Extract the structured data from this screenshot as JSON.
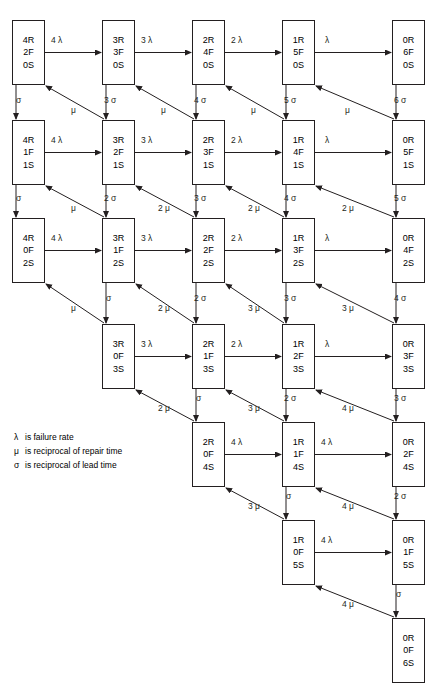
{
  "diagram": {
    "box_width": 33,
    "box_height": 65,
    "col_x": [
      12,
      102,
      192,
      282,
      392
    ],
    "row_y": [
      20,
      120,
      218,
      324,
      422,
      520,
      618
    ],
    "nodes": [
      {
        "id": "r1c1",
        "row": 0,
        "col": 0,
        "lines": [
          "4R",
          "2F",
          "0S"
        ]
      },
      {
        "id": "r1c2",
        "row": 0,
        "col": 1,
        "lines": [
          "3R",
          "3F",
          "0S"
        ]
      },
      {
        "id": "r1c3",
        "row": 0,
        "col": 2,
        "lines": [
          "2R",
          "4F",
          "0S"
        ]
      },
      {
        "id": "r1c4",
        "row": 0,
        "col": 3,
        "lines": [
          "1R",
          "5F",
          "0S"
        ]
      },
      {
        "id": "r1c5",
        "row": 0,
        "col": 4,
        "lines": [
          "0R",
          "6F",
          "0S"
        ]
      },
      {
        "id": "r2c1",
        "row": 1,
        "col": 0,
        "lines": [
          "4R",
          "1F",
          "1S"
        ]
      },
      {
        "id": "r2c2",
        "row": 1,
        "col": 1,
        "lines": [
          "3R",
          "2F",
          "1S"
        ]
      },
      {
        "id": "r2c3",
        "row": 1,
        "col": 2,
        "lines": [
          "2R",
          "3F",
          "1S"
        ]
      },
      {
        "id": "r2c4",
        "row": 1,
        "col": 3,
        "lines": [
          "1R",
          "4F",
          "1S"
        ]
      },
      {
        "id": "r2c5",
        "row": 1,
        "col": 4,
        "lines": [
          "0R",
          "5F",
          "1S"
        ]
      },
      {
        "id": "r3c1",
        "row": 2,
        "col": 0,
        "lines": [
          "4R",
          "0F",
          "2S"
        ]
      },
      {
        "id": "r3c2",
        "row": 2,
        "col": 1,
        "lines": [
          "3R",
          "1F",
          "2S"
        ]
      },
      {
        "id": "r3c3",
        "row": 2,
        "col": 2,
        "lines": [
          "2R",
          "2F",
          "2S"
        ]
      },
      {
        "id": "r3c4",
        "row": 2,
        "col": 3,
        "lines": [
          "1R",
          "3F",
          "2S"
        ]
      },
      {
        "id": "r3c5",
        "row": 2,
        "col": 4,
        "lines": [
          "0R",
          "4F",
          "2S"
        ]
      },
      {
        "id": "r4c2",
        "row": 3,
        "col": 1,
        "lines": [
          "3R",
          "0F",
          "3S"
        ]
      },
      {
        "id": "r4c3",
        "row": 3,
        "col": 2,
        "lines": [
          "2R",
          "1F",
          "3S"
        ]
      },
      {
        "id": "r4c4",
        "row": 3,
        "col": 3,
        "lines": [
          "1R",
          "2F",
          "3S"
        ]
      },
      {
        "id": "r4c5",
        "row": 3,
        "col": 4,
        "lines": [
          "0R",
          "3F",
          "3S"
        ]
      },
      {
        "id": "r5c3",
        "row": 4,
        "col": 2,
        "lines": [
          "2R",
          "0F",
          "4S"
        ]
      },
      {
        "id": "r5c4",
        "row": 4,
        "col": 3,
        "lines": [
          "1R",
          "1F",
          "4S"
        ]
      },
      {
        "id": "r5c5",
        "row": 4,
        "col": 4,
        "lines": [
          "0R",
          "2F",
          "4S"
        ]
      },
      {
        "id": "r6c4",
        "row": 5,
        "col": 3,
        "lines": [
          "1R",
          "0F",
          "5S"
        ]
      },
      {
        "id": "r6c5",
        "row": 5,
        "col": 4,
        "lines": [
          "0R",
          "1F",
          "5S"
        ]
      },
      {
        "id": "r7c5",
        "row": 6,
        "col": 4,
        "lines": [
          "0R",
          "0F",
          "6S"
        ]
      }
    ],
    "horizontal_edges": [
      {
        "from": "r1c1",
        "to": "r1c2",
        "label": "4 λ",
        "x": 51,
        "y": 36
      },
      {
        "from": "r1c2",
        "to": "r1c3",
        "label": "3 λ",
        "x": 141,
        "y": 36
      },
      {
        "from": "r1c3",
        "to": "r1c4",
        "label": "2 λ",
        "x": 231,
        "y": 36
      },
      {
        "from": "r1c4",
        "to": "r1c5",
        "label": "λ",
        "x": 325,
        "y": 36
      },
      {
        "from": "r2c1",
        "to": "r2c2",
        "label": "4 λ",
        "x": 51,
        "y": 136
      },
      {
        "from": "r2c2",
        "to": "r2c3",
        "label": "3 λ",
        "x": 141,
        "y": 136
      },
      {
        "from": "r2c3",
        "to": "r2c4",
        "label": "2 λ",
        "x": 231,
        "y": 136
      },
      {
        "from": "r2c4",
        "to": "r2c5",
        "label": "λ",
        "x": 325,
        "y": 136
      },
      {
        "from": "r3c1",
        "to": "r3c2",
        "label": "4 λ",
        "x": 51,
        "y": 234
      },
      {
        "from": "r3c2",
        "to": "r3c3",
        "label": "3 λ",
        "x": 141,
        "y": 234
      },
      {
        "from": "r3c3",
        "to": "r3c4",
        "label": "2 λ",
        "x": 231,
        "y": 234
      },
      {
        "from": "r3c4",
        "to": "r3c5",
        "label": "λ",
        "x": 325,
        "y": 234
      },
      {
        "from": "r4c2",
        "to": "r4c3",
        "label": "3 λ",
        "x": 141,
        "y": 340
      },
      {
        "from": "r4c3",
        "to": "r4c4",
        "label": "2 λ",
        "x": 231,
        "y": 340
      },
      {
        "from": "r4c4",
        "to": "r4c5",
        "label": "λ",
        "x": 325,
        "y": 340
      },
      {
        "from": "r5c3",
        "to": "r5c4",
        "label": "4 λ",
        "x": 231,
        "y": 438
      },
      {
        "from": "r5c4",
        "to": "r5c5",
        "label": "4 λ",
        "x": 321,
        "y": 438
      },
      {
        "from": "r6c4",
        "to": "r6c5",
        "label": "4 λ",
        "x": 321,
        "y": 536
      }
    ],
    "vertical_edges": [
      {
        "from": "r1c1",
        "to": "r2c1",
        "label": "σ",
        "x": 16,
        "y": 96
      },
      {
        "from": "r1c2",
        "to": "r2c2",
        "label": "3 σ",
        "x": 104,
        "y": 96
      },
      {
        "from": "r1c3",
        "to": "r2c3",
        "label": "4 σ",
        "x": 194,
        "y": 96
      },
      {
        "from": "r1c4",
        "to": "r2c4",
        "label": "5 σ",
        "x": 284,
        "y": 96
      },
      {
        "from": "r1c5",
        "to": "r2c5",
        "label": "6 σ",
        "x": 394,
        "y": 96
      },
      {
        "from": "r2c1",
        "to": "r3c1",
        "label": "σ",
        "x": 16,
        "y": 194
      },
      {
        "from": "r2c2",
        "to": "r3c2",
        "label": "2 σ",
        "x": 104,
        "y": 194
      },
      {
        "from": "r2c3",
        "to": "r3c3",
        "label": "3 σ",
        "x": 194,
        "y": 194
      },
      {
        "from": "r2c4",
        "to": "r3c4",
        "label": "4 σ",
        "x": 284,
        "y": 194
      },
      {
        "from": "r2c5",
        "to": "r3c5",
        "label": "5 σ",
        "x": 394,
        "y": 194
      },
      {
        "from": "r3c2",
        "to": "r4c2",
        "label": "σ",
        "x": 106,
        "y": 294
      },
      {
        "from": "r3c3",
        "to": "r4c3",
        "label": "2 σ",
        "x": 194,
        "y": 294
      },
      {
        "from": "r3c4",
        "to": "r4c4",
        "label": "3 σ",
        "x": 284,
        "y": 294
      },
      {
        "from": "r3c5",
        "to": "r4c5",
        "label": "4 σ",
        "x": 394,
        "y": 294
      },
      {
        "from": "r4c3",
        "to": "r5c3",
        "label": "σ",
        "x": 196,
        "y": 394
      },
      {
        "from": "r4c4",
        "to": "r5c4",
        "label": "2 σ",
        "x": 284,
        "y": 394
      },
      {
        "from": "r4c5",
        "to": "r5c5",
        "label": "3 σ",
        "x": 394,
        "y": 394
      },
      {
        "from": "r5c4",
        "to": "r6c4",
        "label": "σ",
        "x": 286,
        "y": 492
      },
      {
        "from": "r5c5",
        "to": "r6c5",
        "label": "2 σ",
        "x": 394,
        "y": 492
      },
      {
        "from": "r6c5",
        "to": "r7c5",
        "label": "σ",
        "x": 396,
        "y": 590
      }
    ],
    "diagonal_edges": [
      {
        "from": "r2c2",
        "to": "r1c1",
        "label": "μ",
        "x": 71,
        "y": 106
      },
      {
        "from": "r2c3",
        "to": "r1c2",
        "label": "μ",
        "x": 161,
        "y": 106
      },
      {
        "from": "r2c4",
        "to": "r1c3",
        "label": "μ",
        "x": 251,
        "y": 106
      },
      {
        "from": "r2c5",
        "to": "r1c4",
        "label": "μ",
        "x": 345,
        "y": 106
      },
      {
        "from": "r3c2",
        "to": "r2c1",
        "label": "μ",
        "x": 71,
        "y": 204
      },
      {
        "from": "r3c3",
        "to": "r2c2",
        "label": "2 μ",
        "x": 158,
        "y": 204
      },
      {
        "from": "r3c4",
        "to": "r2c3",
        "label": "2 μ",
        "x": 248,
        "y": 204
      },
      {
        "from": "r3c5",
        "to": "r2c4",
        "label": "2 μ",
        "x": 342,
        "y": 204
      },
      {
        "from": "r4c2",
        "to": "r3c1",
        "label": "μ",
        "x": 71,
        "y": 304
      },
      {
        "from": "r4c3",
        "to": "r3c2",
        "label": "2 μ",
        "x": 158,
        "y": 304
      },
      {
        "from": "r4c4",
        "to": "r3c3",
        "label": "3 μ",
        "x": 248,
        "y": 304
      },
      {
        "from": "r4c5",
        "to": "r3c4",
        "label": "3 μ",
        "x": 342,
        "y": 304
      },
      {
        "from": "r5c3",
        "to": "r4c2",
        "label": "2 μ",
        "x": 158,
        "y": 404
      },
      {
        "from": "r5c4",
        "to": "r4c3",
        "label": "3 μ",
        "x": 248,
        "y": 404
      },
      {
        "from": "r5c5",
        "to": "r4c4",
        "label": "4 μ",
        "x": 342,
        "y": 404
      },
      {
        "from": "r6c4",
        "to": "r5c3",
        "label": "3 μ",
        "x": 248,
        "y": 502
      },
      {
        "from": "r6c5",
        "to": "r5c4",
        "label": "4 μ",
        "x": 342,
        "y": 502
      },
      {
        "from": "r7c5",
        "to": "r6c4",
        "label": "4 μ",
        "x": 342,
        "y": 600
      }
    ]
  },
  "legend": {
    "rows": [
      {
        "symbol": "λ",
        "text": "is failure rate"
      },
      {
        "symbol": "μ",
        "text": "is reciprocal of repair time"
      },
      {
        "symbol": "σ",
        "text": "is reciprocal of lead time"
      }
    ]
  }
}
